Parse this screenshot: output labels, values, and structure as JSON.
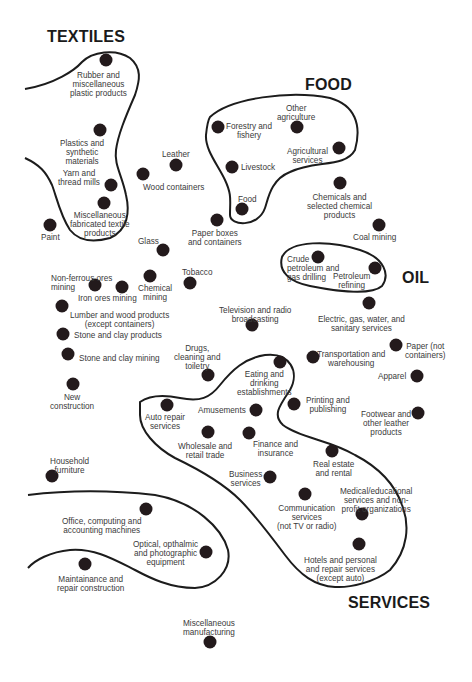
{
  "clusters": {
    "textiles": "TEXTILES",
    "food": "FOOD",
    "oil": "OIL",
    "services": "SERVICES"
  },
  "industries": {
    "rubber": "Rubber and\nmiscellaneous\nplastic products",
    "plastics": "Plastics and\nsynthetic\nmaterials",
    "yarn": "Yarn and\nthread mills",
    "misc_textile": "Miscellaneous\nfabricated textile\nproducts",
    "paint": "Paint",
    "leather": "Leather",
    "wood_containers": "Wood containers",
    "glass": "Glass",
    "paper_boxes": "Paper boxes\nand containers",
    "forestry": "Forestry and\nfishery",
    "other_agriculture": "Other\nagriculture",
    "agricultural_services": "Agricultural\nservices",
    "livestock": "Livestock",
    "food": "Food",
    "chemicals_selected": "Chemicals and\nselected chemical\nproducts",
    "coal_mining": "Coal mining",
    "crude_petroleum": "Crude\npetroleum and\ngas drilling",
    "petroleum_refining": "Petroleum\nrefining",
    "nonferrous": "Non-ferrous ores\nmining",
    "iron_ores": "Iron ores mining",
    "chemical_mining": "Chemical\nmining",
    "tobacco": "Tobacco",
    "lumber": "Lumber and wood products\n(except containers)",
    "stone_clay_products": "Stone and clay products",
    "stone_clay_mining": "Stone and clay mining",
    "tv_radio": "Television and radio\nbroadcasting",
    "electric": "Electric, gas, water, and\nsanitary services",
    "drugs": "Drugs,\ncleaning and\ntoiletry",
    "transportation": "Transportation and\nwarehousing",
    "paper_not_containers": "Paper (not\ncontainers)",
    "apparel": "Apparel",
    "new_construction": "New\nconstruction",
    "eating": "Eating and\ndrinking\nestablishments",
    "auto_repair": "Auto repair\nservices",
    "amusements": "Amusements",
    "printing": "Printing and\npublishing",
    "footwear": "Footwear and\nother leather\nproducts",
    "wholesale": "Wholesale and\nretail trade",
    "finance": "Finance and\ninsurance",
    "household_furniture": "Household\nfurniture",
    "real_estate": "Real estate\nand rental",
    "business_services": "Business\nservices",
    "medical": "Medical/educational\nservices and non-\nprofit organizations",
    "communication": "Communication\nservices\n(not TV or radio)",
    "office_computing": "Office, computing and\naccounting machines",
    "optical": "Optical, opthalmic\nand photographic\nequipment",
    "hotels": "Hotels and personal\nand repair services\n(except auto)",
    "maintenance": "Maintainance and\nrepair construction",
    "misc_manufacturing": "Miscellaneous\nmanufacturing"
  },
  "colors": {
    "dot": "#231a1c",
    "outline": "#1c1c1c",
    "text": "#3a3a3a",
    "background": "#ffffff"
  }
}
